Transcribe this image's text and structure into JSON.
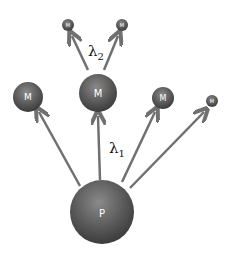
{
  "diagram": {
    "colors": {
      "node": "#5a5a5a",
      "node_dark": "#3c3c3c",
      "node_light": "#8a8a8a",
      "arrow": "#707070",
      "label": "#ffffff",
      "text": "#111111"
    },
    "nodes": [
      {
        "id": "P",
        "label": "P",
        "cx": 102,
        "cy": 212,
        "r": 32
      },
      {
        "id": "M_left",
        "label": "M",
        "cx": 28,
        "cy": 97,
        "r": 15
      },
      {
        "id": "M_center",
        "label": "M",
        "cx": 98,
        "cy": 93,
        "r": 19
      },
      {
        "id": "M_right",
        "label": "M",
        "cx": 163,
        "cy": 98,
        "r": 11
      },
      {
        "id": "M_far_right",
        "label": "M",
        "cx": 212,
        "cy": 101,
        "r": 6
      },
      {
        "id": "M_top_left",
        "label": "M",
        "cx": 68,
        "cy": 25,
        "r": 6
      },
      {
        "id": "M_top_right",
        "label": "M",
        "cx": 122,
        "cy": 25,
        "r": 6
      }
    ],
    "edges": [
      {
        "from": "P",
        "to": "M_left"
      },
      {
        "from": "P",
        "to": "M_center"
      },
      {
        "from": "P",
        "to": "M_right"
      },
      {
        "from": "P",
        "to": "M_far_right"
      },
      {
        "from": "M_center",
        "to": "M_top_left"
      },
      {
        "from": "M_center",
        "to": "M_top_right"
      }
    ],
    "rate_labels": [
      {
        "symbol": "λ",
        "subscript": "1",
        "x": 110,
        "y": 152
      },
      {
        "symbol": "λ",
        "subscript": "2",
        "x": 89,
        "y": 55
      }
    ]
  }
}
